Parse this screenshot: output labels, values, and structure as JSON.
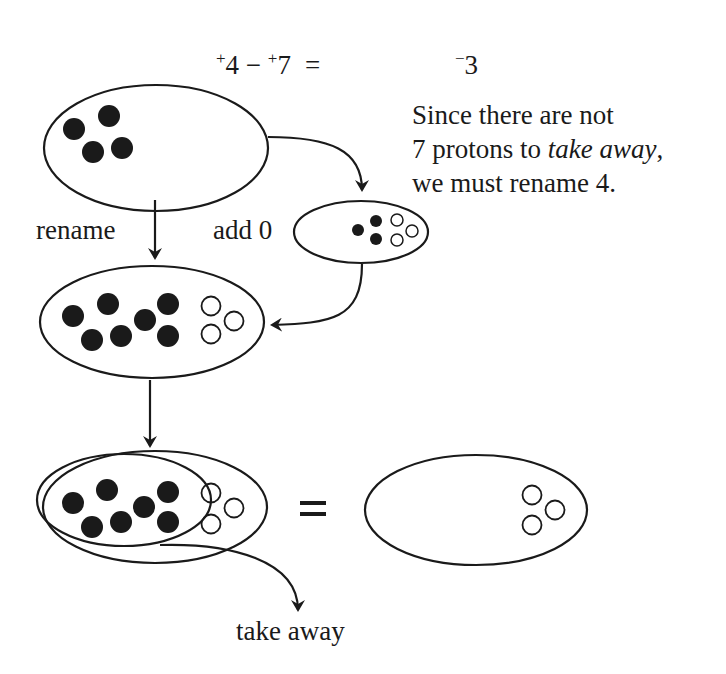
{
  "equation": {
    "left_sign_1": "+",
    "left_num_1": "4",
    "operator": "−",
    "left_sign_2": "+",
    "left_num_2": "7",
    "equals": "=",
    "result_sign": "−",
    "result_num": "3"
  },
  "note": {
    "line1": "Since there are not",
    "line2_prefix": "7 protons to ",
    "line2_italic": "take away",
    "line2_suffix": ",",
    "line3": "we must rename 4."
  },
  "labels": {
    "rename": "rename",
    "add_zero": "add 0",
    "equals": "=",
    "take_away": "take away"
  },
  "diagram": {
    "initial_set": {
      "filled": 4,
      "hollow": 0
    },
    "zero_pairs_added": {
      "filled": 3,
      "hollow": 3
    },
    "renamed_set": {
      "filled": 7,
      "hollow": 3
    },
    "taken_away": {
      "filled": 7,
      "hollow": 0
    },
    "remaining_set": {
      "filled": 0,
      "hollow": 3
    },
    "colors": {
      "ink": "#1a1a1a",
      "background": "#ffffff"
    }
  }
}
